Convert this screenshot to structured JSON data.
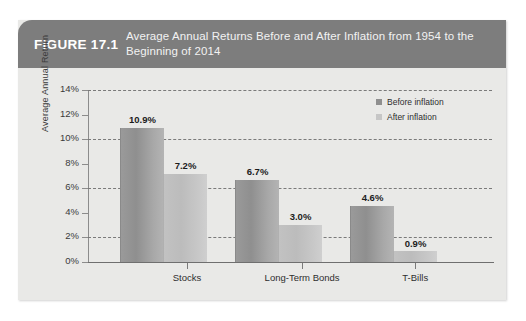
{
  "figure": {
    "label": "FIGURE 17.1",
    "title": "Average Annual Returns Before and After Inflation from 1954 to the Beginning of 2014"
  },
  "legend": {
    "position": "top-right",
    "items": [
      {
        "name": "Before inflation",
        "color": "#8f8f8f"
      },
      {
        "name": "After inflation",
        "color": "#c6c6c6"
      }
    ]
  },
  "chart_data": {
    "type": "bar",
    "title": "Average Annual Returns Before and After Inflation from 1954 to the Beginning of 2014",
    "xlabel": "",
    "ylabel": "Average Annual Return",
    "categories": [
      "Stocks",
      "Long-Term Bonds",
      "T-Bills"
    ],
    "series": [
      {
        "name": "Before inflation",
        "color": "#8f8f8f",
        "values": [
          10.9,
          6.7,
          4.6
        ],
        "labels": [
          "10.9%",
          "7.2%-pair",
          "n/a"
        ]
      },
      {
        "name": "After inflation",
        "color": "#c6c6c6",
        "values": [
          7.2,
          3.0,
          0.9
        ]
      }
    ],
    "value_labels": {
      "Stocks": {
        "before": "10.9%",
        "after": "7.2%"
      },
      "Long-Term Bonds": {
        "before": "6.7%",
        "after": "3.0%"
      },
      "T-Bills": {
        "before": "4.6%",
        "after": "0.9%"
      }
    },
    "ylim": [
      0,
      14
    ],
    "yticks": [
      0,
      2,
      4,
      6,
      8,
      10,
      12,
      14
    ],
    "ytick_labels": [
      "0%",
      "2%",
      "4%",
      "6%",
      "8%",
      "10%",
      "12%",
      "14%"
    ],
    "gridlines_at": [
      2,
      6,
      10,
      14
    ],
    "grid": "dashed-horizontal",
    "legend_position": "top-right",
    "units": "percent"
  },
  "axis": {
    "y_title": "Average Annual Return",
    "ticks": [
      {
        "value": 14,
        "label": "14%",
        "grid": true
      },
      {
        "value": 12,
        "label": "12%",
        "grid": false
      },
      {
        "value": 10,
        "label": "10%",
        "grid": true
      },
      {
        "value": 8,
        "label": "8%",
        "grid": false
      },
      {
        "value": 6,
        "label": "6%",
        "grid": true
      },
      {
        "value": 4,
        "label": "4%",
        "grid": false
      },
      {
        "value": 2,
        "label": "2%",
        "grid": true
      },
      {
        "value": 0,
        "label": "0%",
        "grid": false
      }
    ]
  },
  "groups": [
    {
      "category": "Stocks",
      "center_pct": 24.5,
      "bars": [
        {
          "series": "Before inflation",
          "value": 10.9,
          "label": "10.9%",
          "left_px": 32
        },
        {
          "series": "After inflation",
          "value": 7.2,
          "label": "7.2%",
          "left_px": 75
        }
      ]
    },
    {
      "category": "Long-Term Bonds",
      "center_pct": 53.0,
      "bars": [
        {
          "series": "Before inflation",
          "value": 6.7,
          "label": "6.7%",
          "left_px": 147
        },
        {
          "series": "After inflation",
          "value": 3.0,
          "label": "3.0%",
          "left_px": 190
        }
      ]
    },
    {
      "category": "T-Bills",
      "center_pct": 81.0,
      "bars": [
        {
          "series": "Before inflation",
          "value": 4.6,
          "label": "4.6%",
          "left_px": 262
        },
        {
          "series": "After inflation",
          "value": 0.9,
          "label": "0.9%",
          "left_px": 305
        }
      ]
    }
  ]
}
